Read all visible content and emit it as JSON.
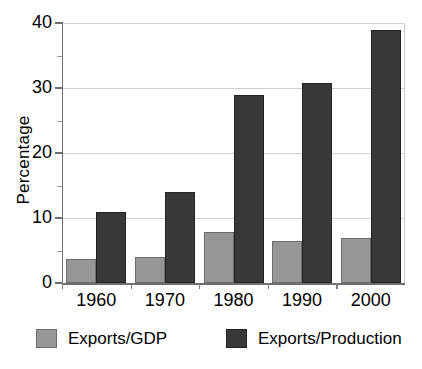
{
  "chart_data": {
    "type": "bar",
    "title": "",
    "xlabel": "",
    "ylabel": "Percentage",
    "categories": [
      "1960",
      "1970",
      "1980",
      "1990",
      "2000"
    ],
    "series": [
      {
        "name": "Exports/GDP",
        "color": "#969696",
        "values": [
          3.7,
          4.0,
          7.8,
          6.5,
          7.0
        ]
      },
      {
        "name": "Exports/Production",
        "color": "#383838",
        "values": [
          11.0,
          14.0,
          29.0,
          30.7,
          39.0
        ]
      }
    ],
    "ylim": [
      0,
      40
    ],
    "yticks": [
      0,
      10,
      20,
      30,
      40
    ],
    "ytick_labels": [
      "0",
      "10",
      "20",
      "30",
      "40"
    ],
    "yticks_minor": [
      5,
      15,
      25,
      35
    ],
    "grid": true,
    "grid_axis": "y",
    "legend_position": "bottom",
    "legend_entries": [
      "Exports/GDP",
      "Exports/Production"
    ]
  },
  "axis": {
    "y_title": "Percentage"
  },
  "legend": {
    "items": [
      {
        "label": "Exports/GDP"
      },
      {
        "label": "Exports/Production"
      }
    ]
  },
  "artifact": {
    "top_title_remnant": ""
  }
}
